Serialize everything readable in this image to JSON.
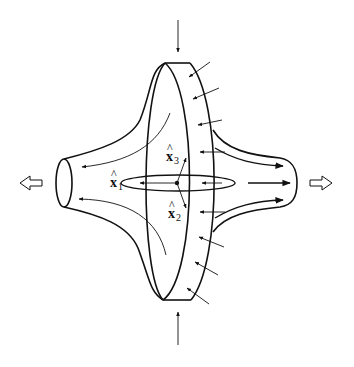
{
  "diagram": {
    "stroke_color": "#111111",
    "background": "#ffffff",
    "labels": {
      "x1": {
        "base": "x",
        "hat": "^",
        "sub": "1"
      },
      "x2": {
        "base": "x",
        "hat": "^",
        "sub": "2"
      },
      "x3": {
        "base": "x",
        "hat": "^",
        "sub": "3"
      }
    },
    "arrows": {
      "outflow_left": "hollow-arrow-left",
      "outflow_right": "hollow-arrow-right",
      "inflow_top": "arrow-down",
      "inflow_bottom": "arrow-up",
      "disk_inflow_count": 9
    }
  }
}
